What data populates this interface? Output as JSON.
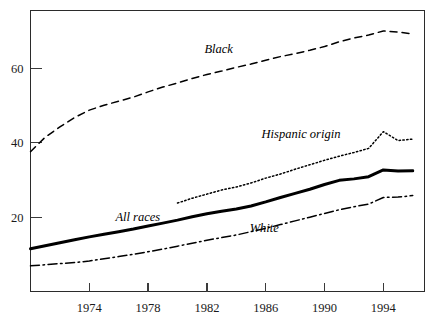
{
  "chart_data": {
    "type": "line",
    "title": "",
    "subtitle": "",
    "xlabel": "",
    "ylabel": "",
    "xlim": [
      1970,
      1996.8
    ],
    "ylim": [
      0,
      75.6
    ],
    "grid": false,
    "legend_position": "inline-labels",
    "x_ticks": [
      "1974",
      "1978",
      "1982",
      "1986",
      "1990",
      "1994"
    ],
    "x_tick_values": [
      1974,
      1978,
      1982,
      1986,
      1990,
      1994
    ],
    "y_ticks": [
      "20",
      "40",
      "60"
    ],
    "y_tick_values": [
      20,
      40,
      60
    ],
    "series": [
      {
        "name": "Black",
        "label": "Black",
        "style": "dashed",
        "x": [
          1970,
          1971,
          1972,
          1973,
          1974,
          1975,
          1976,
          1977,
          1978,
          1979,
          1980,
          1981,
          1982,
          1983,
          1984,
          1985,
          1986,
          1987,
          1988,
          1989,
          1990,
          1991,
          1992,
          1993,
          1994,
          1995,
          1996
        ],
        "values": [
          37.6,
          41.5,
          44.3,
          46.8,
          48.8,
          50.1,
          51.2,
          52.3,
          53.7,
          55.0,
          56.1,
          57.3,
          58.4,
          59.3,
          60.3,
          61.2,
          62.2,
          63.2,
          64.0,
          64.9,
          65.9,
          67.2,
          68.2,
          69.0,
          70.1,
          69.8,
          69.3
        ]
      },
      {
        "name": "Hispanic origin",
        "label": "Hispanic origin",
        "style": "dotted",
        "x": [
          1980,
          1981,
          1982,
          1983,
          1984,
          1985,
          1986,
          1987,
          1988,
          1989,
          1990,
          1991,
          1992,
          1993,
          1994,
          1995,
          1996
        ],
        "values": [
          23.8,
          25.1,
          26.2,
          27.3,
          28.1,
          29.2,
          30.5,
          31.6,
          32.9,
          34.1,
          35.3,
          36.4,
          37.4,
          38.5,
          43.0,
          40.6,
          41.0
        ]
      },
      {
        "name": "All races",
        "label": "All races",
        "style": "solid-thick",
        "x": [
          1970,
          1971,
          1972,
          1973,
          1974,
          1975,
          1976,
          1977,
          1978,
          1979,
          1980,
          1981,
          1982,
          1983,
          1984,
          1985,
          1986,
          1987,
          1988,
          1989,
          1990,
          1991,
          1992,
          1993,
          1994,
          1995,
          1996
        ],
        "values": [
          11.5,
          12.3,
          13.1,
          13.9,
          14.7,
          15.4,
          16.1,
          16.8,
          17.6,
          18.4,
          19.2,
          20.1,
          20.9,
          21.6,
          22.2,
          23.0,
          24.1,
          25.3,
          26.4,
          27.5,
          28.8,
          29.9,
          30.3,
          30.9,
          32.7,
          32.4,
          32.5
        ]
      },
      {
        "name": "White",
        "label": "White",
        "style": "dash-dot",
        "x": [
          1970,
          1971,
          1972,
          1973,
          1974,
          1975,
          1976,
          1977,
          1978,
          1979,
          1980,
          1981,
          1982,
          1983,
          1984,
          1985,
          1986,
          1987,
          1988,
          1989,
          1990,
          1991,
          1992,
          1993,
          1994,
          1995,
          1996
        ],
        "values": [
          6.9,
          7.2,
          7.5,
          7.8,
          8.2,
          8.8,
          9.4,
          10.0,
          10.7,
          11.4,
          12.2,
          13.0,
          13.8,
          14.5,
          15.2,
          16.1,
          17.0,
          18.0,
          19.0,
          20.0,
          21.0,
          22.0,
          22.8,
          23.5,
          25.3,
          25.4,
          25.8
        ]
      }
    ],
    "annotations": [
      {
        "text": "Black",
        "x": 1982.8,
        "y": 64.3,
        "anchor": "middle"
      },
      {
        "text": "Hispanic origin",
        "x": 1988.4,
        "y": 41.2,
        "anchor": "middle"
      },
      {
        "text": "All races",
        "x": 1977.3,
        "y": 19.0,
        "anchor": "middle"
      },
      {
        "text": "White",
        "x": 1985.9,
        "y": 16.0,
        "anchor": "middle"
      }
    ],
    "colors": {
      "line": "#000000",
      "axis": "#2b2b2b",
      "text": "#1a1a1a",
      "background": "#ffffff"
    }
  }
}
